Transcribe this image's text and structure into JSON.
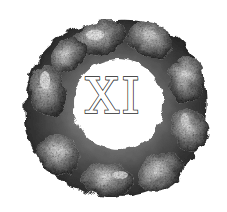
{
  "logo": {
    "numeral": "XI",
    "description": "ring of clasped hands",
    "colors": {
      "background": "#ffffff",
      "ink": "#1a1a1a",
      "mid": "#7a7a7a",
      "light": "#d8d8d8"
    }
  }
}
